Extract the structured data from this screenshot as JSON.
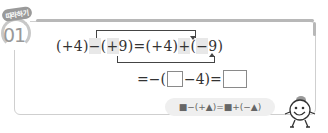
{
  "badge": {
    "label": "따라하기"
  },
  "problem": {
    "number": "01"
  },
  "equation_line1": {
    "term1": "(+4)",
    "op1": "−",
    "term2_open": "(",
    "term2_sign": "+",
    "term2_rest": "9)",
    "equals": "=",
    "term3": "(+4)",
    "op2": "+",
    "term4_open": "(",
    "term4_sign": "−",
    "term4_rest": "9)"
  },
  "equation_line2": {
    "prefix": "=−(",
    "blank1": "",
    "middle": "−4)=",
    "blank2": ""
  },
  "rule_hint": {
    "text": "■−(+▲)=■+(−▲)"
  },
  "colors": {
    "frame": "#cfcfcf",
    "highlight": "#e8e8e8",
    "badge": "#9a9a9a"
  }
}
